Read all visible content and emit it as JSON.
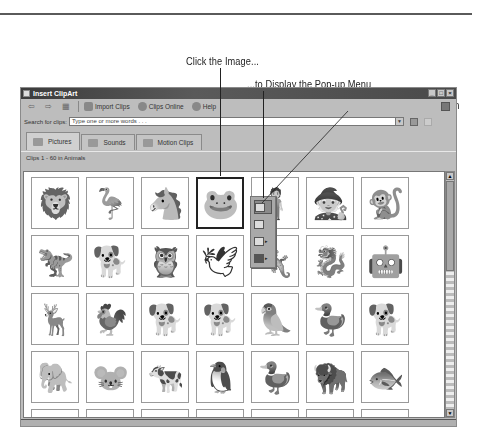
{
  "callouts": [
    {
      "text": "Click the Image..."
    },
    {
      "text": "...to Display the Pop-up Menu"
    },
    {
      "text": "Then Click the Insert Clip Button"
    }
  ],
  "window": {
    "title": "Insert ClipArt",
    "controls": [
      "_",
      "□",
      "×"
    ]
  },
  "toolbar": {
    "back_icon": "⇦",
    "forward_icon": "⇨",
    "all_categories_icon": "▦",
    "import_clips": "Import Clips",
    "clips_online": "Clips Online",
    "help": "Help"
  },
  "search": {
    "label": "Search for clips:",
    "placeholder": "Type one or more words . . ."
  },
  "tabs": [
    {
      "label": "Pictures",
      "active": true
    },
    {
      "label": "Sounds",
      "active": false
    },
    {
      "label": "Motion Clips",
      "active": false
    }
  ],
  "clips_label": "Clips 1 - 60 in Animals",
  "grid": {
    "rows": [
      [
        "lion",
        "heron",
        "horse",
        "frog",
        "girl-with-fish",
        "fairy-tale-figure",
        "monkey"
      ],
      [
        "dinosaur",
        "dog",
        "owl-reading",
        "bird-bath",
        "lizard-branch",
        "dragon",
        "tin-figure"
      ],
      [
        "gazelle",
        "rooster",
        "german-shepherd",
        "scottie-dog",
        "parrot",
        "duck",
        "sitting-dog"
      ],
      [
        "elephant",
        "mouse",
        "cow",
        "penguins",
        "duck-swimming",
        "bison",
        "fish"
      ],
      [
        "bird-small",
        "insect",
        "wave",
        "bird-flying",
        "shark-fin",
        "fish-partial",
        "fin"
      ]
    ],
    "glyphs": [
      [
        "🦁",
        "🦩",
        "🐴",
        "🐸",
        "🧍",
        "🧙",
        "🐒"
      ],
      [
        "🦖",
        "🐕",
        "🦉",
        "🕊",
        "🦎",
        "🐉",
        "🤖"
      ],
      [
        "🦌",
        "🐓",
        "🐕",
        "🐕",
        "🦜",
        "🦆",
        "🐕"
      ],
      [
        "🐘",
        "🐭",
        "🐄",
        "🐧",
        "🦆",
        "🦬",
        "🐟"
      ],
      [
        "🐦",
        "🐜",
        "🌊",
        "🐦",
        "🦈",
        "🐟",
        "◢"
      ]
    ],
    "selected": {
      "row": 0,
      "col": 3
    }
  },
  "popup_menu": {
    "items": [
      {
        "name": "insert-clip",
        "highlighted": true
      },
      {
        "name": "preview-clip",
        "highlighted": false
      },
      {
        "name": "add-to-favorites",
        "has_submenu": true
      },
      {
        "name": "find-similar-clips",
        "has_submenu": true
      }
    ],
    "submenu_arrow": "▸"
  },
  "scrollbar": {
    "up": "▲",
    "down": "▼"
  }
}
